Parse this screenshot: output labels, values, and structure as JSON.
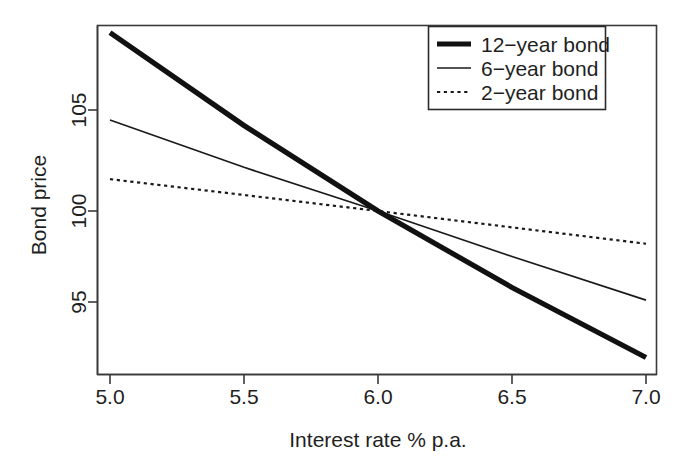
{
  "chart_data": {
    "type": "line",
    "title": "",
    "subtitle": "",
    "xlabel": "Interest rate % p.a.",
    "ylabel": "Bond price",
    "xlim": [
      4.92,
      7.08
    ],
    "ylim": [
      91.3,
      110.4
    ],
    "xticks": [
      "5.0",
      "5.5",
      "6.0",
      "6.5",
      "7.0"
    ],
    "xtick_values": [
      5.0,
      5.5,
      6.0,
      6.5,
      7.0
    ],
    "yticks": [
      "95",
      "100",
      "105"
    ],
    "ytick_values": [
      95,
      100,
      105
    ],
    "grid": false,
    "legend_position": "top-right",
    "x": [
      5.0,
      5.5,
      6.0,
      6.5,
      7.0
    ],
    "series": [
      {
        "name": "12-year bond",
        "label": "12−year bond",
        "style": "solid",
        "linewidth": 5,
        "color": "#111111",
        "values": [
          109.8,
          104.7,
          100.0,
          95.8,
          91.95
        ]
      },
      {
        "name": "6-year bond",
        "label": "6−year bond",
        "style": "solid",
        "linewidth": 1.6,
        "color": "#1a1a1a",
        "values": [
          105.0,
          102.4,
          100.0,
          97.5,
          95.1
        ]
      },
      {
        "name": "2-year bond",
        "label": "2−year bond",
        "style": "dotted",
        "linewidth": 2.2,
        "color": "#1a1a1a",
        "values": [
          101.75,
          100.88,
          100.0,
          99.1,
          98.2
        ]
      }
    ]
  },
  "axes": {
    "x_title": "Interest rate % p.a.",
    "y_title": "Bond price",
    "x_tick_labels": [
      "5.0",
      "5.5",
      "6.0",
      "6.5",
      "7.0"
    ],
    "y_tick_labels": [
      "95",
      "100",
      "105"
    ]
  },
  "legend": {
    "entries": [
      {
        "label": "12−year bond",
        "style": "thick-solid"
      },
      {
        "label": "6−year bond",
        "style": "thin-solid"
      },
      {
        "label": "2−year bond",
        "style": "dotted"
      }
    ]
  },
  "colors": {
    "background": "#ffffff",
    "foreground": "#1a1a1a",
    "axis": "#333333"
  }
}
